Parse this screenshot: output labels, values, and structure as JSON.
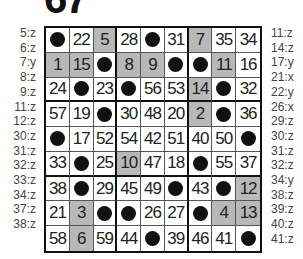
{
  "puzzle": {
    "number_partial": "67"
  },
  "left_labels": [
    "5:z",
    "6:z",
    "7:y",
    "8:z",
    "9:z",
    "11:z",
    "12:z",
    "30:z",
    "31:z",
    "32:z",
    "33:z",
    "34:z",
    "37:z",
    "38:z"
  ],
  "right_labels": [
    "11:z",
    "14:z",
    "17:y",
    "21:x",
    "22:y",
    "26:x",
    "29:z",
    "30:z",
    "31:z",
    "32:z",
    "34:y",
    "38:z",
    "39:z",
    "40:z",
    "41:z"
  ],
  "colors": {
    "shaded": "#b8b8b8",
    "dot": "#111111",
    "border": "#111111"
  },
  "grid": [
    [
      {
        "v": "●"
      },
      {
        "v": "22"
      },
      {
        "v": "5",
        "s": 1
      },
      {
        "v": "28"
      },
      {
        "v": "●"
      },
      {
        "v": "31"
      },
      {
        "v": "7",
        "s": 1
      },
      {
        "v": "35"
      },
      {
        "v": "34"
      }
    ],
    [
      {
        "v": "1",
        "s": 1
      },
      {
        "v": "15",
        "s": 1
      },
      {
        "v": "●"
      },
      {
        "v": "8",
        "s": 1
      },
      {
        "v": "9",
        "s": 1
      },
      {
        "v": "●"
      },
      {
        "v": "●"
      },
      {
        "v": "11",
        "s": 1
      },
      {
        "v": "16"
      }
    ],
    [
      {
        "v": "24"
      },
      {
        "v": "●"
      },
      {
        "v": "23"
      },
      {
        "v": "●"
      },
      {
        "v": "56"
      },
      {
        "v": "53"
      },
      {
        "v": "14",
        "s": 1
      },
      {
        "v": "●"
      },
      {
        "v": "32"
      }
    ],
    [
      {
        "v": "57"
      },
      {
        "v": "19"
      },
      {
        "v": "●"
      },
      {
        "v": "30"
      },
      {
        "v": "48"
      },
      {
        "v": "20"
      },
      {
        "v": "2",
        "s": 1
      },
      {
        "v": "●"
      },
      {
        "v": "36"
      }
    ],
    [
      {
        "v": "●"
      },
      {
        "v": "17"
      },
      {
        "v": "52"
      },
      {
        "v": "54"
      },
      {
        "v": "42"
      },
      {
        "v": "51"
      },
      {
        "v": "40"
      },
      {
        "v": "50"
      },
      {
        "v": "●"
      }
    ],
    [
      {
        "v": "33"
      },
      {
        "v": "●"
      },
      {
        "v": "25"
      },
      {
        "v": "10",
        "s": 1
      },
      {
        "v": "47"
      },
      {
        "v": "18"
      },
      {
        "v": "●"
      },
      {
        "v": "55"
      },
      {
        "v": "37"
      }
    ],
    [
      {
        "v": "38"
      },
      {
        "v": "●"
      },
      {
        "v": "29"
      },
      {
        "v": "45"
      },
      {
        "v": "49"
      },
      {
        "v": "●"
      },
      {
        "v": "43"
      },
      {
        "v": "●"
      },
      {
        "v": "12",
        "s": 1
      }
    ],
    [
      {
        "v": "21"
      },
      {
        "v": "3",
        "s": 1
      },
      {
        "v": "●"
      },
      {
        "v": "●"
      },
      {
        "v": "26"
      },
      {
        "v": "27"
      },
      {
        "v": "●"
      },
      {
        "v": "4",
        "s": 1
      },
      {
        "v": "13",
        "s": 1
      }
    ],
    [
      {
        "v": "58"
      },
      {
        "v": "6",
        "s": 1
      },
      {
        "v": "59"
      },
      {
        "v": "44"
      },
      {
        "v": "●"
      },
      {
        "v": "39"
      },
      {
        "v": "46"
      },
      {
        "v": "41"
      },
      {
        "v": "●"
      }
    ]
  ]
}
